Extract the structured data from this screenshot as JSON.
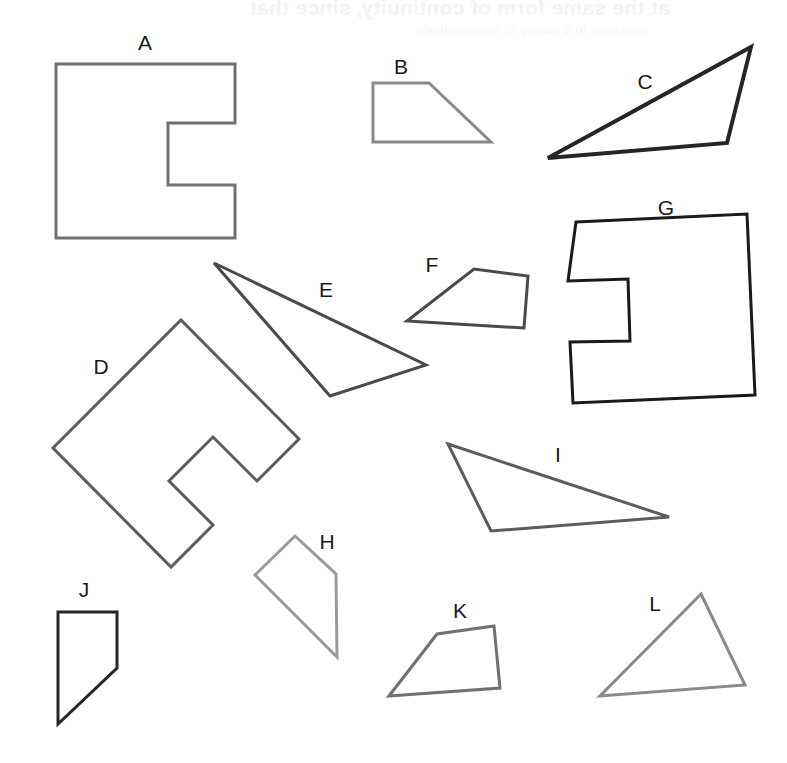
{
  "page": {
    "width": 787,
    "height": 763,
    "background": "#ffffff",
    "faint_bleedthrough_line1": "at the same form of continuity, since that",
    "faint_bleedthrough_line2": "reference to a variety of configurations"
  },
  "figure": {
    "label_count": 12,
    "labels": [
      "A",
      "B",
      "C",
      "D",
      "E",
      "F",
      "G",
      "H",
      "I",
      "J",
      "K",
      "L"
    ]
  },
  "colors": {
    "dark": "#262626",
    "medium_dark": "#4a4a4a",
    "medium": "#5c5c5c",
    "gray": "#707070",
    "light_gray": "#8a8a8a",
    "label": "#1a1a1a",
    "page_background": "#ffffff"
  },
  "shapes": [
    {
      "id": "A",
      "label": "A",
      "kind": "notched-square",
      "label_x": 145,
      "label_y": 50,
      "stroke": "#707070",
      "stroke_width": 3,
      "points": "56,64 235,64 235,123 168,123 168,185 235,185 235,238 56,238"
    },
    {
      "id": "B",
      "label": "B",
      "kind": "trapezoid",
      "label_x": 401,
      "label_y": 74,
      "stroke": "#8a8a8a",
      "stroke_width": 3,
      "points": "373,83 429,83 491,142 373,142"
    },
    {
      "id": "C",
      "label": "C",
      "kind": "triangle",
      "label_x": 645,
      "label_y": 89,
      "stroke": "#262626",
      "stroke_width": 4,
      "points": "548,158 751,47 727,143"
    },
    {
      "id": "D",
      "label": "D",
      "kind": "notched-square-rotated",
      "label_x": 101,
      "label_y": 374,
      "stroke": "#5c5c5c",
      "stroke_width": 3,
      "points": "181,320 299,439 257,481 213,437 169,481 213,525 171,567 53,448"
    },
    {
      "id": "E",
      "label": "E",
      "kind": "triangle",
      "label_x": 326,
      "label_y": 297,
      "stroke": "#4a4a4a",
      "stroke_width": 3,
      "points": "214,263 426,365 330,396"
    },
    {
      "id": "F",
      "label": "F",
      "kind": "quadrilateral",
      "label_x": 432,
      "label_y": 272,
      "stroke": "#4a4a4a",
      "stroke_width": 3,
      "points": "407,321 474,269 528,276 524,328"
    },
    {
      "id": "G",
      "label": "G",
      "kind": "notched-square",
      "label_x": 666,
      "label_y": 215,
      "stroke": "#1a1a1a",
      "stroke_width": 3,
      "points": "576,222 747,214 755,395 573,403 570,342 630,341 628,279 568,281"
    },
    {
      "id": "H",
      "label": "H",
      "kind": "quadrilateral",
      "label_x": 327,
      "label_y": 549,
      "stroke": "#9a9a9a",
      "stroke_width": 3,
      "points": "295,536 336,574 337,657 255,575"
    },
    {
      "id": "I",
      "label": "I",
      "kind": "triangle",
      "label_x": 558,
      "label_y": 462,
      "stroke": "#5c5c5c",
      "stroke_width": 3,
      "points": "448,444 669,517 491,531"
    },
    {
      "id": "J",
      "label": "J",
      "kind": "quadrilateral",
      "label_x": 84,
      "label_y": 597,
      "stroke": "#262626",
      "stroke_width": 3,
      "points": "58,612 117,612 117,668 58,724"
    },
    {
      "id": "K",
      "label": "K",
      "kind": "quadrilateral",
      "label_x": 460,
      "label_y": 618,
      "stroke": "#707070",
      "stroke_width": 3,
      "points": "389,696 437,634 494,626 500,688"
    },
    {
      "id": "L",
      "label": "L",
      "kind": "triangle",
      "label_x": 655,
      "label_y": 611,
      "stroke": "#8a8a8a",
      "stroke_width": 3,
      "points": "701,594 745,685 600,696"
    }
  ]
}
